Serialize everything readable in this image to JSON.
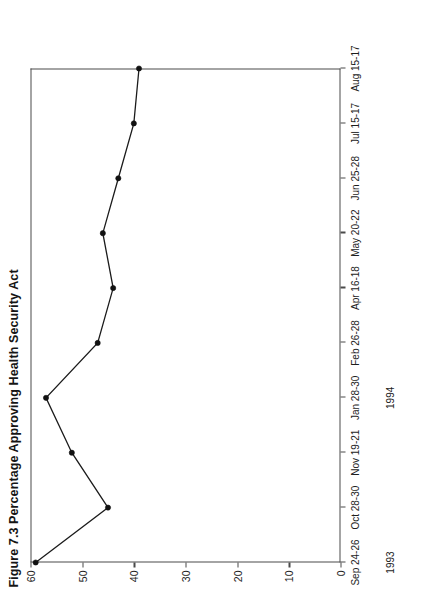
{
  "figure": {
    "number": "Figure 7.3",
    "title": "Percentage Approving Health Security Act",
    "full_title": "Figure 7.3 Percentage Approving Health Security Act",
    "rotation": "90deg counter-clockwise (printed sideways)"
  },
  "chart_data": {
    "type": "line",
    "title": "Figure 7.3 Percentage Approving Health Security Act",
    "xlabel": "",
    "ylabel": "",
    "ylim": [
      0,
      60
    ],
    "yticks": [
      0,
      10,
      20,
      30,
      40,
      50,
      60
    ],
    "ytick_labels": [
      "0",
      "10",
      "20",
      "30",
      "40",
      "50",
      "60"
    ],
    "grid": false,
    "legend": "none",
    "categories": [
      "Sep 24-26",
      "Oct 28-30",
      "Nov 19-21",
      "Jan 28-30",
      "Feb 26-28",
      "Apr 16-18",
      "May 20-22",
      "Jun 25-28",
      "Jul 15-17",
      "Aug 15-17"
    ],
    "values": [
      59,
      45,
      52,
      57,
      47,
      44,
      46,
      43,
      40,
      39
    ],
    "year_groups": [
      {
        "label": "1993",
        "at_category": "Sep 24-26"
      },
      {
        "label": "1994",
        "at_category": "Jan 28-30"
      }
    ],
    "marker": "filled-circle",
    "line_color": "#1b1b1b",
    "marker_color": "#111111"
  },
  "axis": {
    "year_1993": "1993",
    "year_1994": "1994"
  }
}
